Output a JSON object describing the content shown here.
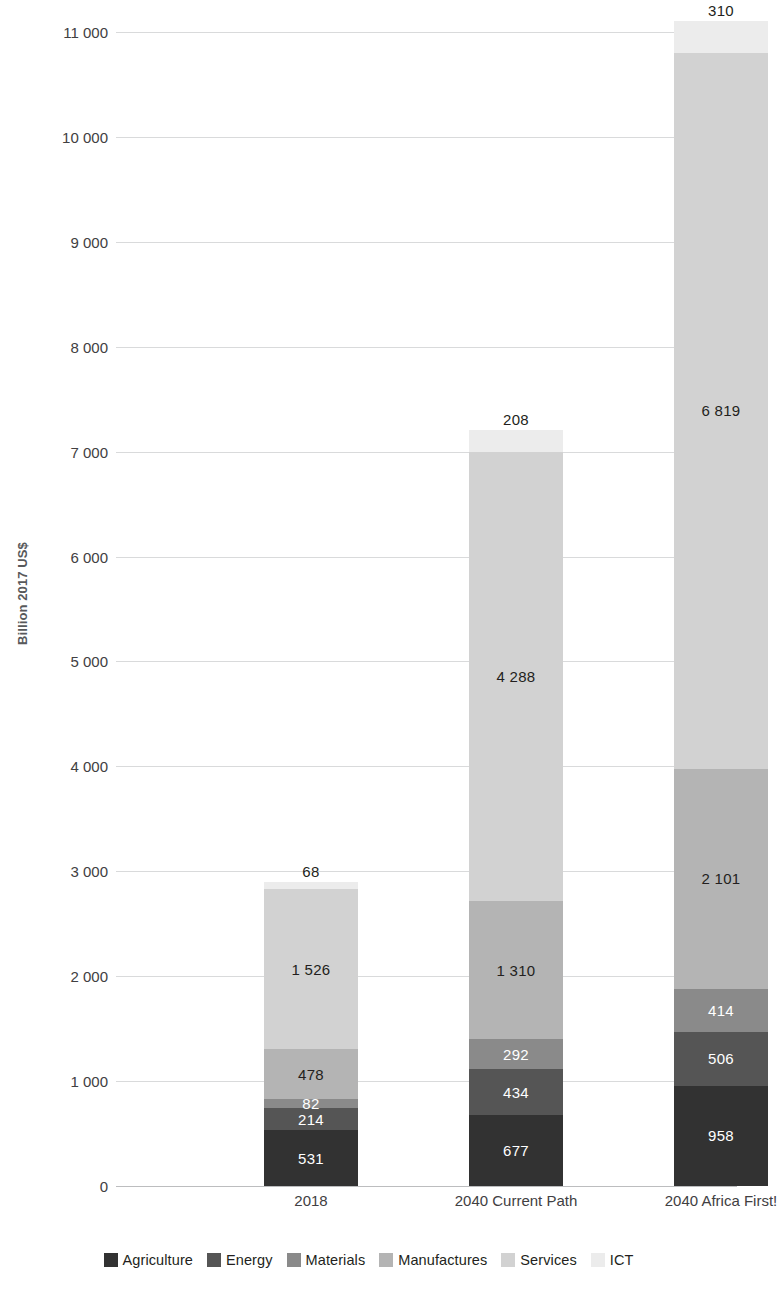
{
  "chart_data": {
    "type": "bar",
    "stacked": true,
    "title": "",
    "subtitle": "",
    "xlabel": "",
    "ylabel": "Billion 2017 US$",
    "ylim": [
      0,
      11000
    ],
    "ytick_values": [
      0,
      1000,
      2000,
      3000,
      4000,
      5000,
      6000,
      7000,
      8000,
      9000,
      10000,
      11000
    ],
    "ytick_labels": [
      "0",
      "1 000",
      "2 000",
      "3 000",
      "4 000",
      "5 000",
      "6 000",
      "7 000",
      "8 000",
      "9 000",
      "10 000",
      "11 000"
    ],
    "grid": true,
    "legend_position": "bottom",
    "categories": [
      "2018",
      "2040 Current Path",
      "2040 Africa First!"
    ],
    "series": [
      {
        "name": "Agriculture",
        "color": "#323232",
        "values": [
          531,
          677,
          958
        ]
      },
      {
        "name": "Energy",
        "color": "#555555",
        "values": [
          214,
          434,
          506
        ]
      },
      {
        "name": "Materials",
        "color": "#8a8a8a",
        "values": [
          82,
          292,
          414
        ]
      },
      {
        "name": "Manufactures",
        "color": "#b4b4b4",
        "values": [
          478,
          1310,
          2101
        ]
      },
      {
        "name": "Services",
        "color": "#d2d2d2",
        "values": [
          1526,
          4288,
          6819
        ]
      },
      {
        "name": "ICT",
        "color": "#ececec",
        "values": [
          68,
          208,
          310
        ]
      }
    ],
    "data_labels": {
      "2018": {
        "Agriculture": "531",
        "Energy": "214",
        "Materials": "82",
        "Manufactures": "478",
        "Services": "1 526",
        "ICT": "68"
      },
      "2040 Current Path": {
        "Agriculture": "677",
        "Energy": "434",
        "Materials": "292",
        "Manufactures": "1 310",
        "Services": "4 288",
        "ICT": "208"
      },
      "2040 Africa First!": {
        "Agriculture": "958",
        "Energy": "506",
        "Materials": "414",
        "Manufactures": "2 101",
        "Services": "6 819",
        "ICT": "310"
      }
    },
    "totals": [
      2899,
      7209,
      11108
    ]
  },
  "axis": {
    "y_title": "Billion 2017 US$"
  },
  "legend": {
    "items": [
      {
        "label": "Agriculture",
        "color": "#323232"
      },
      {
        "label": "Energy",
        "color": "#555555"
      },
      {
        "label": "Materials",
        "color": "#8a8a8a"
      },
      {
        "label": "Manufactures",
        "color": "#b4b4b4"
      },
      {
        "label": "Services",
        "color": "#d2d2d2"
      },
      {
        "label": "ICT",
        "color": "#ececec"
      }
    ]
  }
}
